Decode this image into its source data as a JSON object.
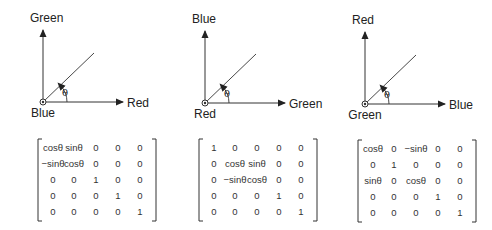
{
  "diagrams": [
    {
      "title": "rotation-about-blue",
      "vertical_axis_label": "Green",
      "horizontal_axis_label": "Red",
      "origin_axis_label": "Blue",
      "angle_label": "θ",
      "matrix": [
        [
          "cosθ",
          "sinθ",
          "0",
          "0",
          "0"
        ],
        [
          "−sinθ",
          "cosθ",
          "0",
          "0",
          "0"
        ],
        [
          "0",
          "0",
          "1",
          "0",
          "0"
        ],
        [
          "0",
          "0",
          "0",
          "1",
          "0"
        ],
        [
          "0",
          "0",
          "0",
          "0",
          "1"
        ]
      ]
    },
    {
      "title": "rotation-about-red",
      "vertical_axis_label": "Blue",
      "horizontal_axis_label": "Green",
      "origin_axis_label": "Red",
      "angle_label": "θ",
      "matrix": [
        [
          "1",
          "0",
          "0",
          "0",
          "0"
        ],
        [
          "0",
          "cosθ",
          "sinθ",
          "0",
          "0"
        ],
        [
          "0",
          "−sinθ",
          "cosθ",
          "0",
          "0"
        ],
        [
          "0",
          "0",
          "0",
          "1",
          "0"
        ],
        [
          "0",
          "0",
          "0",
          "0",
          "1"
        ]
      ]
    },
    {
      "title": "rotation-about-green",
      "vertical_axis_label": "Red",
      "horizontal_axis_label": "Blue",
      "origin_axis_label": "Green",
      "angle_label": "θ",
      "matrix": [
        [
          "cosθ",
          "0",
          "−sinθ",
          "0",
          "0"
        ],
        [
          "0",
          "1",
          "0",
          "0",
          "0"
        ],
        [
          "sinθ",
          "0",
          "cosθ",
          "0",
          "0"
        ],
        [
          "0",
          "0",
          "0",
          "1",
          "0"
        ],
        [
          "0",
          "0",
          "0",
          "0",
          "1"
        ]
      ]
    }
  ],
  "colors": {
    "stroke": "#333333",
    "text": "#222222"
  }
}
